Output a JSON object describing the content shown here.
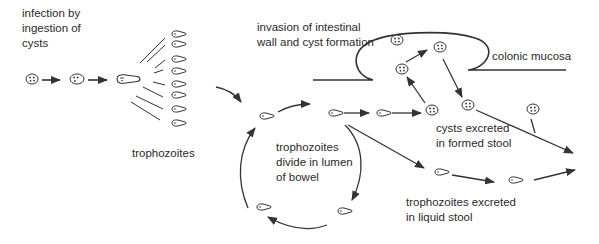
{
  "colors": {
    "stroke": "#333333",
    "text": "#2a2a2a",
    "background": "#ffffff"
  },
  "labels": {
    "infection": "infection by\ningestion of\ncysts",
    "trophozoites": "trophozoites",
    "invasion": "invasion of intestinal\nwall and cyst formation",
    "colonic_mucosa": "colonic mucosa",
    "divide": "trophozoites\ndivide in lumen\nof bowel",
    "cysts_excreted": "cysts excreted\nin formed stool",
    "trophozoites_excreted": "trophozoites excreted\nin liquid stool"
  },
  "stages": [
    {
      "id": "ingested-cyst",
      "icon": "cyst-icon"
    },
    {
      "id": "excysting-cyst",
      "icon": "cyst-icon"
    },
    {
      "id": "excysting-trophozoite",
      "icon": "trophozoite-icon"
    },
    {
      "id": "released-trophozoites",
      "icon": "trophozoite-icon",
      "count": 8
    },
    {
      "id": "lumen-division-cycle",
      "icon": "trophozoite-icon",
      "count": 4
    },
    {
      "id": "wall-invasion-cysts",
      "icon": "cyst-icon",
      "count": 3
    },
    {
      "id": "formed-stool-cysts",
      "icon": "cyst-icon",
      "count": 2
    },
    {
      "id": "liquid-stool-trophozoites",
      "icon": "trophozoite-icon",
      "count": 2
    }
  ]
}
